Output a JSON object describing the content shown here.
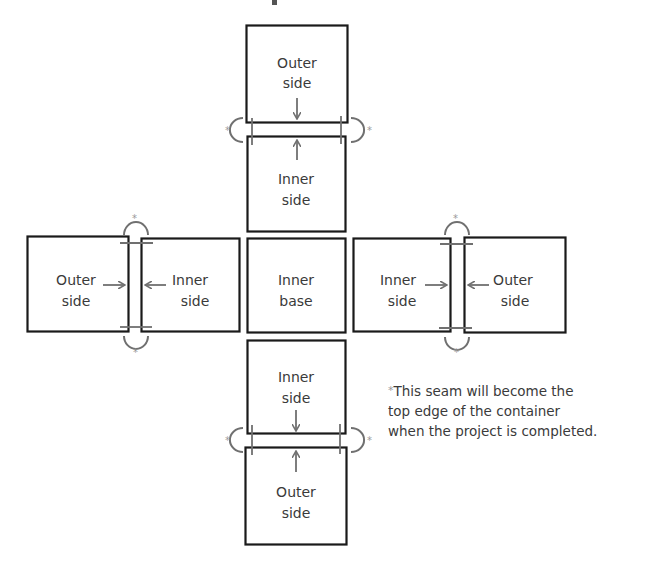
{
  "diagram": {
    "type": "box-assembly-net",
    "colors": {
      "box_stroke": "#1a1a1a",
      "seam": "#707070",
      "text": "#3a3a3a",
      "asterisk": "#999999"
    },
    "panels": [
      {
        "id": "top-outer",
        "lines": [
          "Outer",
          "side"
        ]
      },
      {
        "id": "top-inner",
        "lines": [
          "Inner",
          "side"
        ]
      },
      {
        "id": "left-outer",
        "lines": [
          "Outer",
          "side"
        ]
      },
      {
        "id": "left-inner",
        "lines": [
          "Inner",
          "side"
        ]
      },
      {
        "id": "center-base",
        "lines": [
          "Inner",
          "base"
        ]
      },
      {
        "id": "right-inner",
        "lines": [
          "Inner",
          "side"
        ]
      },
      {
        "id": "right-outer",
        "lines": [
          "Outer",
          "side"
        ]
      },
      {
        "id": "bottom-inner",
        "lines": [
          "Inner",
          "side"
        ]
      },
      {
        "id": "bottom-outer",
        "lines": [
          "Outer",
          "side"
        ]
      }
    ],
    "seam_marker": "*",
    "footnote": {
      "marker": "*",
      "lines": [
        "This seam will become the",
        "top edge of the container",
        "when the project is completed."
      ]
    }
  }
}
